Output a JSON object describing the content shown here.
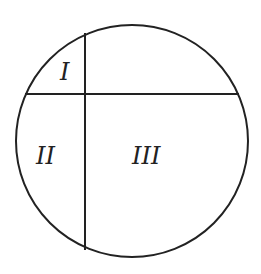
{
  "diagram": {
    "type": "circle-partition",
    "stroke_color": "#222222",
    "background": "#ffffff",
    "regions": [
      {
        "id": "region-1",
        "label": "I"
      },
      {
        "id": "region-2",
        "label": "II"
      },
      {
        "id": "region-3",
        "label": "III"
      }
    ]
  }
}
